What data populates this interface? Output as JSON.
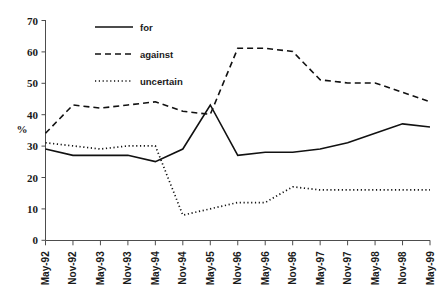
{
  "chart_data": {
    "type": "line",
    "title": "",
    "xlabel": "",
    "ylabel": "%",
    "ylim": [
      0,
      70
    ],
    "ytick_step": 10,
    "yticks": [
      0,
      10,
      20,
      30,
      40,
      50,
      60,
      70
    ],
    "grid": false,
    "legend_position": "top-center",
    "categories": [
      "May-92",
      "Nov-92",
      "May-93",
      "Nov-93",
      "May-94",
      "Nov-94",
      "May-95",
      "Nov-96",
      "May-96",
      "Nov-96",
      "May-97",
      "Nov-97",
      "May-98",
      "Nov-98",
      "May-99"
    ],
    "series": [
      {
        "name": "for",
        "style": "solid",
        "values": [
          29,
          27,
          27,
          27,
          25,
          29,
          43,
          27,
          28,
          28,
          29,
          31,
          34,
          37,
          36
        ]
      },
      {
        "name": "against",
        "style": "dashed",
        "values": [
          34,
          43,
          42,
          43,
          44,
          41,
          40,
          61,
          61,
          60,
          51,
          50,
          50,
          47,
          44
        ]
      },
      {
        "name": "uncertain",
        "style": "dotted",
        "values": [
          31,
          30,
          29,
          30,
          30,
          8,
          10,
          12,
          12,
          17,
          16,
          16,
          16,
          16,
          16
        ]
      }
    ]
  },
  "yaxis": {
    "labels": [
      "70",
      "60",
      "50",
      "40",
      "30",
      "20",
      "10",
      "0"
    ],
    "title": "%"
  },
  "xaxis": {
    "labels": [
      "May-92",
      "Nov-92",
      "May-93",
      "Nov-93",
      "May-94",
      "Nov-94",
      "May-95",
      "Nov-96",
      "May-96",
      "Nov-96",
      "May-97",
      "Nov-97",
      "May-98",
      "Nov-98",
      "May-99"
    ]
  },
  "legend": {
    "items": [
      {
        "label": "for",
        "style": "solid"
      },
      {
        "label": "against",
        "style": "dashed"
      },
      {
        "label": "uncertain",
        "style": "dotted"
      }
    ]
  },
  "colors": {
    "line": "#111111",
    "axis": "#4d4d4d",
    "text": "#1a1a1a",
    "background": "#ffffff"
  }
}
